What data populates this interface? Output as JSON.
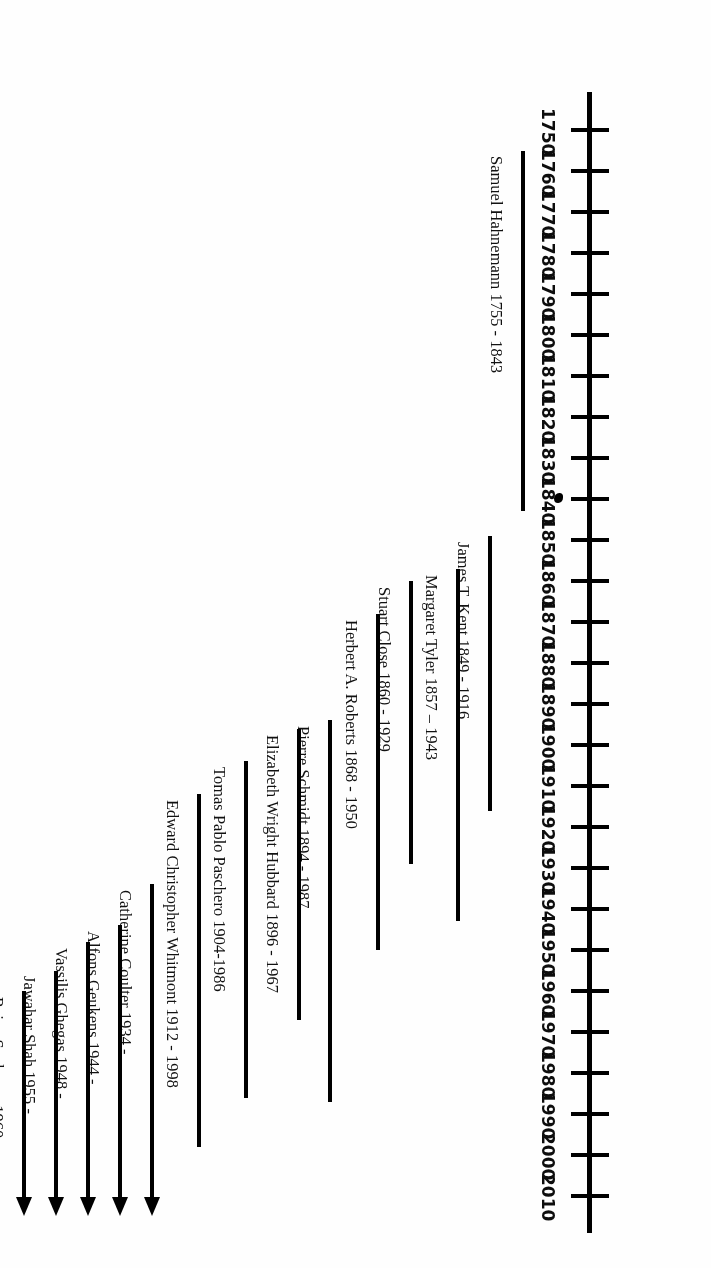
{
  "chart_data": {
    "type": "timeline",
    "title": "",
    "orientation": "vertical-axis-rotated-180",
    "axis": {
      "label": "",
      "min": 1750,
      "max": 2010,
      "step": 10,
      "tick_labels": [
        "2010",
        "2000",
        "1990",
        "1980",
        "1970",
        "1960",
        "1950",
        "1940",
        "1930",
        "1920",
        "1910",
        "1900",
        "1890",
        "1880",
        "1870",
        "1860",
        "1850",
        "1840",
        "1830",
        "1820",
        "1810",
        "1800",
        "1790",
        "1780",
        "1770",
        "1760",
        "1750"
      ],
      "grid": false
    },
    "legend": {
      "visible": false,
      "position": "none"
    },
    "annotations": [
      {
        "name": "ink-blob",
        "near_year": 1840,
        "text": ""
      }
    ],
    "entries": [
      {
        "label": "Samuel Hahnemann 1755 - 1843",
        "start": 1755,
        "end": 1843,
        "ongoing": false,
        "track": 0
      },
      {
        "label": "James T. Kent 1849 - 1916",
        "start": 1849,
        "end": 1916,
        "ongoing": false,
        "track": 1
      },
      {
        "label": "Margaret Tyler 1857 – 1943",
        "start": 1857,
        "end": 1943,
        "ongoing": false,
        "track": 2
      },
      {
        "label": "Stuart Close 1860 - 1929",
        "start": 1860,
        "end": 1929,
        "ongoing": false,
        "track": 3
      },
      {
        "label": "Herbert A. Roberts 1868 - 1950",
        "start": 1868,
        "end": 1950,
        "ongoing": false,
        "track": 4
      },
      {
        "label": "Pierre Schmidt 1894 - 1987",
        "start": 1894,
        "end": 1987,
        "ongoing": false,
        "track": 5
      },
      {
        "label": "Elizabeth Wright Hubbard 1896 - 1967",
        "start": 1896,
        "end": 1967,
        "ongoing": false,
        "track": 6
      },
      {
        "label": "Tomas Pablo Paschero 1904-1986",
        "start": 1904,
        "end": 1986,
        "ongoing": false,
        "track": 7
      },
      {
        "label": "Edward Christopher Whitmont 1912 - 1998",
        "start": 1912,
        "end": 1998,
        "ongoing": false,
        "track": 8
      },
      {
        "label": "Catherine Coulter 1934 -",
        "start": 1934,
        "end": 2014,
        "ongoing": true,
        "track": 9
      },
      {
        "label": "Alfons Geukens 1944 -",
        "start": 1944,
        "end": 2014,
        "ongoing": true,
        "track": 10
      },
      {
        "label": "Vassilis Ghegas 1948 -",
        "start": 1948,
        "end": 2014,
        "ongoing": true,
        "track": 11
      },
      {
        "label": "Jawahar Shah 1955 -",
        "start": 1955,
        "end": 2014,
        "ongoing": true,
        "track": 12
      },
      {
        "label": "Rajan Sankaran 1960 -",
        "start": 1960,
        "end": 2014,
        "ongoing": true,
        "track": 13
      }
    ]
  },
  "colors": {
    "ink": "#000000",
    "background": "#ffffff",
    "label": "#111111"
  }
}
